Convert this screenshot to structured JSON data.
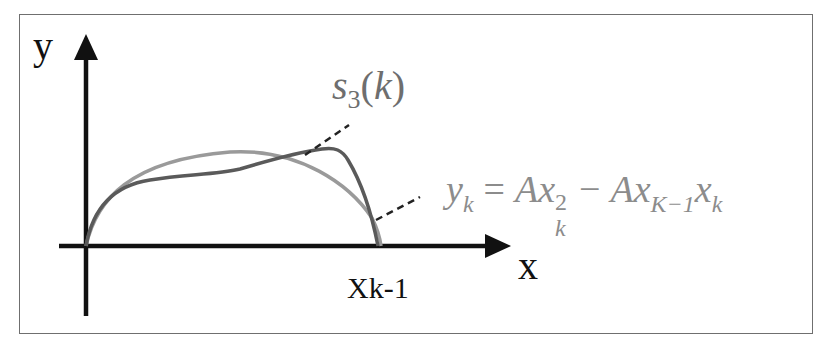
{
  "diagram": {
    "axes": {
      "y_label": "y",
      "x_label": "x",
      "x_tick_label": "Xk-1"
    },
    "curves": [
      {
        "name": "s3(k)",
        "label": {
          "symbol": "s",
          "subscript": "3",
          "open_paren": "(",
          "argument": "k",
          "close_paren": ")"
        },
        "color": "#5a5a5a",
        "description": "piecewise cubic approximation curve"
      },
      {
        "name": "parabola",
        "label": {
          "lhs": "y",
          "lhs_sub": "k",
          "equals": "=",
          "term1_coef": "A",
          "term1_var": "x",
          "term1_sup": "2",
          "term1_sub": "k",
          "minus": "−",
          "term2_coef": "A",
          "term2_var1": "x",
          "term2_sub1": "K−1",
          "term2_var2": "x",
          "term2_sub2": "k"
        },
        "color": "#9a9a9a",
        "description": "y_k = A x_k^2 − A x_{K−1} x_k"
      }
    ],
    "colors": {
      "frame": "#6f6f6f",
      "axes": "#111111",
      "s3_curve": "#5a5a5a",
      "parabola_curve": "#9a9a9a",
      "leader_lines": "#222222"
    }
  }
}
